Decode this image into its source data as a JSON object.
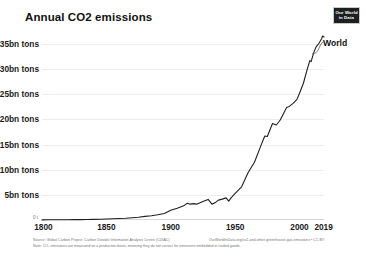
{
  "header": {
    "title": "Annual CO2 emissions",
    "logo": {
      "name": "our-world-in-data-logo",
      "line1": "Our World",
      "line2": "in Data"
    }
  },
  "footer": {
    "source": "Source: Global Carbon Project; Carbon Dioxide Information Analysis Centre (CDIAC)",
    "note": "Note: CO₂ emissions are measured on a production basis, meaning they do not correct for emissions embedded in traded goods.",
    "url": "OurWorldInData.org/co2-and-other-greenhouse-gas-emissions • CC BY"
  },
  "chart_data": {
    "type": "line",
    "title": "Annual CO2 emissions",
    "subtitle": "",
    "xlabel": "",
    "ylabel": "",
    "xlim": [
      1800,
      2019
    ],
    "ylim": [
      0,
      37
    ],
    "grid": true,
    "legend_position": "inline-end-of-line",
    "y_tick_labels": [
      "5bn tons",
      "10bn tons",
      "15bn tons",
      "20bn tons",
      "25bn tons",
      "30bn tons",
      "35bn tons"
    ],
    "y_tick_values": [
      5,
      10,
      15,
      20,
      25,
      30,
      35
    ],
    "y_zero_label": "0 t",
    "x_tick_labels": [
      "1800",
      "1850",
      "1900",
      "1950",
      "2000",
      "2019"
    ],
    "x_tick_values": [
      1800,
      1850,
      1900,
      1950,
      2000,
      2019
    ],
    "series": [
      {
        "name": "World",
        "label": "World",
        "color": "#1d1f20",
        "units": "billion tonnes CO2",
        "x": [
          1800,
          1805,
          1810,
          1815,
          1820,
          1825,
          1830,
          1835,
          1840,
          1845,
          1850,
          1855,
          1860,
          1865,
          1870,
          1875,
          1880,
          1885,
          1890,
          1895,
          1900,
          1905,
          1910,
          1913,
          1915,
          1918,
          1920,
          1925,
          1929,
          1932,
          1935,
          1937,
          1940,
          1943,
          1945,
          1947,
          1950,
          1955,
          1960,
          1965,
          1970,
          1973,
          1975,
          1979,
          1982,
          1985,
          1988,
          1990,
          1992,
          1995,
          1998,
          2000,
          2003,
          2006,
          2008,
          2009,
          2011,
          2013,
          2015,
          2017,
          2018,
          2019
        ],
        "y": [
          0.03,
          0.04,
          0.05,
          0.06,
          0.06,
          0.07,
          0.08,
          0.1,
          0.13,
          0.16,
          0.2,
          0.25,
          0.31,
          0.36,
          0.46,
          0.56,
          0.72,
          0.85,
          1.05,
          1.3,
          1.95,
          2.35,
          2.85,
          3.35,
          3.15,
          3.25,
          3.15,
          3.7,
          4.1,
          3.15,
          3.55,
          3.95,
          4.15,
          4.4,
          3.75,
          4.45,
          5.3,
          6.6,
          9.4,
          11.5,
          14.8,
          16.7,
          16.6,
          19.2,
          18.9,
          19.9,
          21.4,
          22.4,
          22.6,
          23.2,
          24.0,
          25.2,
          27.2,
          30.0,
          31.7,
          31.5,
          33.3,
          34.5,
          35.1,
          36.0,
          36.6,
          36.4
        ]
      }
    ],
    "annotations": [
      {
        "text": "World",
        "at_x": 2019,
        "at_y": 36.4
      }
    ]
  }
}
